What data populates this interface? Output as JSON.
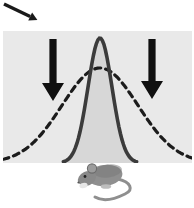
{
  "figure": {
    "background": "#ffffff",
    "pointer_arrow": {
      "color": "#1a1a1a",
      "angle_deg": 25.5,
      "length": 29,
      "stroke_width": 3.4
    },
    "panel": {
      "bg": "#e9e9e9",
      "left": 3,
      "top": 31,
      "width": 189,
      "height": 132
    }
  },
  "chart_data": {
    "type": "line",
    "title": "",
    "grid": false,
    "legend": "none",
    "x_range": [
      0,
      189
    ],
    "baseline_y": 132,
    "series": [
      {
        "name": "wide-distribution-dashed",
        "style": "dashed",
        "center_x": 97,
        "peak_y": 37,
        "sigma": 38,
        "span_sigma": 3.0,
        "stroke": "#1c1c1c",
        "stroke_width": 3.2,
        "dash": "6 5",
        "fill": "none"
      },
      {
        "name": "narrow-distribution-solid",
        "style": "solid",
        "center_x": 97,
        "peak_y": 7,
        "sigma": 12,
        "span_sigma": 3.05,
        "stroke": "#3b3b3b",
        "stroke_width": 3.6,
        "dash": "",
        "fill": "#d7d7d7"
      }
    ],
    "annotations": {
      "down_arrows": [
        {
          "cx": 50,
          "top": 8,
          "head_top": 52,
          "tip": 70,
          "shaft_half": 3.6,
          "head_half": 11,
          "color": "#101010"
        },
        {
          "cx": 149,
          "top": 8,
          "head_top": 50,
          "tip": 68,
          "shaft_half": 3.6,
          "head_half": 11,
          "color": "#101010"
        }
      ]
    }
  },
  "mouse": {
    "body": "#8f8f8f",
    "back": "#7a7a7a",
    "head": "#898989",
    "ear": "#9c9c9c",
    "ear_edge": "#6c6c6c",
    "eye": "#222222",
    "nose": "#555555",
    "tail": "#8f8f8f",
    "paw": "#e6e6e6",
    "foot": "#bdbdbd"
  }
}
